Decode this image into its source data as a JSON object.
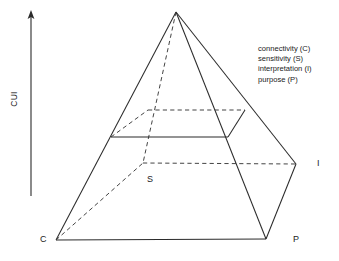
{
  "figure": {
    "axis": {
      "label": "CUI",
      "name": "cui-axis",
      "direction": "up",
      "x": 31,
      "y_top": 12,
      "y_bottom": 196
    },
    "legend": {
      "items": [
        "connectivity (C)",
        "sensitivity (S)",
        "interpretation (I)",
        "purpose (P)"
      ]
    },
    "vertex_labels": {
      "c": "C",
      "s": "S",
      "i": "I",
      "p": "P"
    },
    "colors": {
      "stroke": "#2b2b2b",
      "text": "#1b1b1b",
      "background": "#ffffff"
    },
    "geometry": {
      "apex": [
        176,
        12
      ],
      "base_front_left": [
        56,
        240
      ],
      "base_front_right": [
        266,
        239
      ],
      "base_right": [
        296,
        164
      ],
      "base_back_hidden": [
        143,
        163
      ],
      "mid_front_left": [
        111,
        137
      ],
      "mid_front_right": [
        228,
        137
      ],
      "mid_right_back": [
        245,
        110
      ],
      "mid_back_left": [
        148,
        110
      ]
    }
  }
}
